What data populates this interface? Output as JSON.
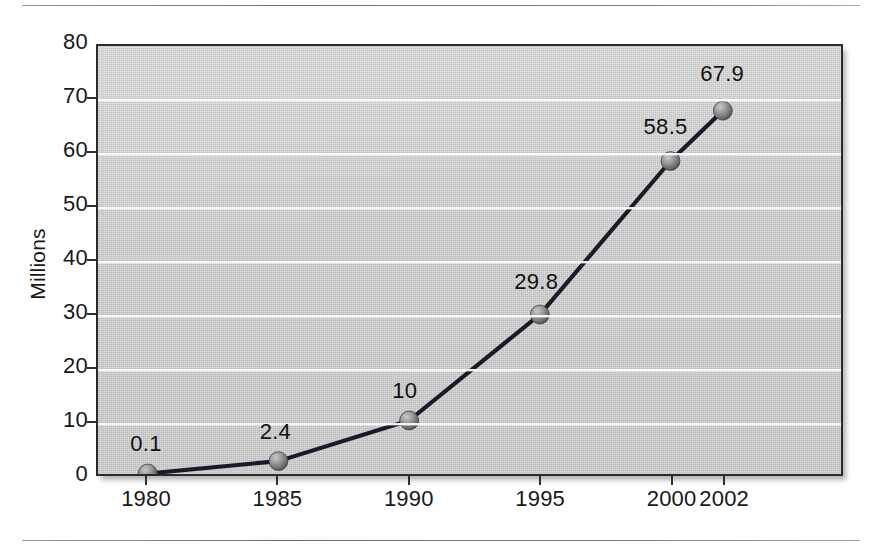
{
  "figure": {
    "background_color": "#d6d6d6",
    "frame_color": "#2a2a2a",
    "line_color": "#1a1a28",
    "marker_color": "#8a8a8a",
    "gridline_color": "#ffffff"
  },
  "chart_data": {
    "type": "line",
    "title": "",
    "xlabel": "",
    "ylabel": "Millions",
    "categories": [
      "1980",
      "1985",
      "1990",
      "1995",
      "2000",
      "2002"
    ],
    "values": [
      0.1,
      2.4,
      10,
      29.8,
      58.5,
      67.9
    ],
    "point_labels": [
      "0.1",
      "2.4",
      "10",
      "29.8",
      "58.5",
      "67.9"
    ],
    "ylim": [
      0,
      80
    ],
    "yticks": [
      0,
      10,
      20,
      30,
      40,
      50,
      60,
      70,
      80
    ],
    "ytick_labels": [
      "0",
      "10",
      "20",
      "30",
      "40",
      "50",
      "60",
      "70",
      "80"
    ],
    "xtick_labels": [
      "1980",
      "1985",
      "1990",
      "1995",
      "2000",
      "2002"
    ],
    "grid": true,
    "grid_axis": "y",
    "legend": false,
    "legend_position": "none",
    "marker": "sphere",
    "series": [
      {
        "name": "Millions",
        "values": [
          0.1,
          2.4,
          10,
          29.8,
          58.5,
          67.9
        ]
      }
    ]
  }
}
